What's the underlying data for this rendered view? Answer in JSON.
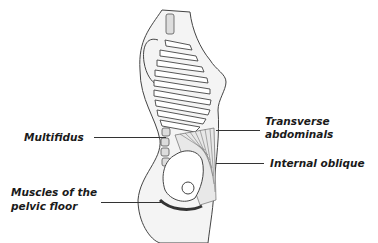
{
  "diagram": {
    "labels": {
      "multifidus": "Multifidus",
      "transverse_line1": "Transverse",
      "transverse_line2": "abdominals",
      "internal_oblique": "Internal oblique",
      "pelvic_line1": "Muscles of the",
      "pelvic_line2": "pelvic floor"
    },
    "colors": {
      "outline": "#333333",
      "body_fill": "#f2f2f2",
      "bone_fill": "#ffffff",
      "text": "#1a1a1a"
    }
  }
}
